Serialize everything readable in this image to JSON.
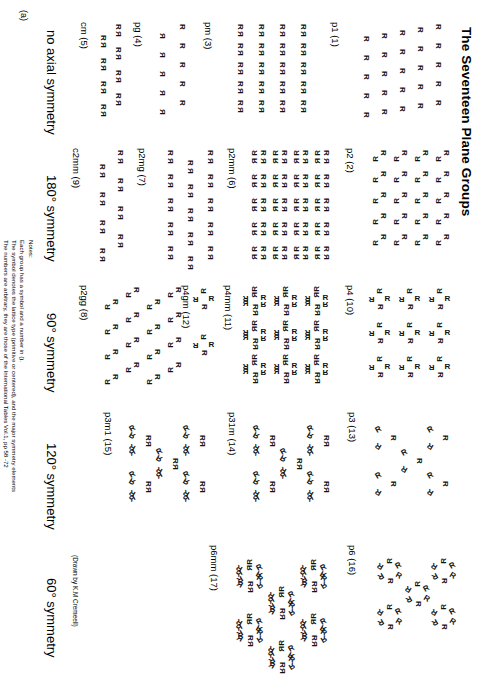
{
  "page": {
    "title": "The Seventeen Plane Groups",
    "corner_label": "(a)",
    "credit": "(Drawn by K.M Cremeell)"
  },
  "notes": {
    "heading": "Notes:",
    "lines": [
      "Each group has a symbol and a number in ().",
      "The symbol denotes the lattice type (primitive or centered), and the major symmetry elements",
      "The numbers are arbitrary, they are those of the International Tables Vol.1, pp 58 -72"
    ]
  },
  "columns": [
    {
      "id": "col-1",
      "header": "no axial symmetry",
      "groups": [
        {
          "label": "p1  (1)"
        },
        {
          "label": "pm  (3)"
        },
        {
          "label": "pg  (4)"
        },
        {
          "label": "cm  (5)"
        }
      ]
    },
    {
      "id": "col-2",
      "header": "180° symmetry",
      "groups": [
        {
          "label": "p2  (2)"
        },
        {
          "label": "p2mm  (6)"
        },
        {
          "label": "p2mg  (7)"
        },
        {
          "label": "c2mm  (9)"
        },
        {
          "label": "p2gg  (8)"
        }
      ]
    },
    {
      "id": "col-3",
      "header": "90° symmetry",
      "groups": [
        {
          "label": "p4  (10)"
        },
        {
          "label": "p4mm  (11)"
        },
        {
          "label": "p4gm  (12)"
        }
      ]
    },
    {
      "id": "col-4",
      "header": "120° symmetry",
      "groups": [
        {
          "label": "p3  (13)"
        },
        {
          "label": "p31m  (14)"
        },
        {
          "label": "p3m1  (15)"
        }
      ]
    },
    {
      "id": "col-5",
      "header": "60° symmetry",
      "groups": [
        {
          "label": "p6  (16)"
        },
        {
          "label": "p6mm  (17)"
        }
      ]
    }
  ],
  "motif": {
    "glyph": "R"
  }
}
